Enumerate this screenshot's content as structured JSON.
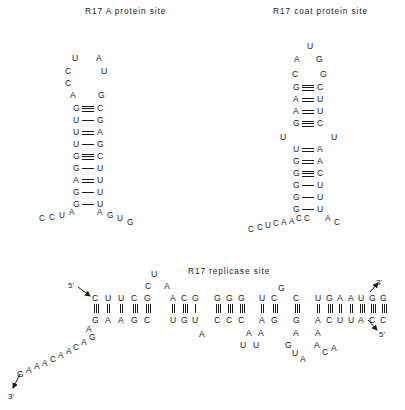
{
  "figure": {
    "background": "#ffffff",
    "ink": "#1a1a1a"
  },
  "panels": {
    "a_protein": {
      "title": "R17 A protein site",
      "loop_left": [
        "U",
        "C",
        "C",
        "A"
      ],
      "loop_right": [
        "A",
        "U",
        "G"
      ],
      "stem": [
        {
          "left": "G",
          "bond": "triple",
          "right": "C"
        },
        {
          "left": "U",
          "bond": "single",
          "right": "G"
        },
        {
          "left": "U",
          "bond": "double",
          "right": "A"
        },
        {
          "left": "U",
          "bond": "single",
          "right": "G"
        },
        {
          "left": "G",
          "bond": "triple",
          "right": "C"
        },
        {
          "left": "G",
          "bond": "single",
          "right": "U"
        },
        {
          "left": "A",
          "bond": "double",
          "right": "U"
        },
        {
          "left": "G",
          "bond": "single",
          "right": "U"
        },
        {
          "left": "G",
          "bond": "single",
          "right": "U"
        }
      ],
      "tail_left": [
        "C",
        "C",
        "U",
        "A"
      ],
      "tail_right": [
        "A",
        "G",
        "U",
        "G"
      ]
    },
    "coat_protein": {
      "title": "R17 coat protein site",
      "loop_top": "U",
      "loop_left": [
        "A",
        "C"
      ],
      "loop_right": [
        "G",
        "G"
      ],
      "stem_upper": [
        {
          "left": "G",
          "bond": "triple",
          "right": "C"
        },
        {
          "left": "A",
          "bond": "double",
          "right": "U"
        },
        {
          "left": "A",
          "bond": "double",
          "right": "U"
        },
        {
          "left": "G",
          "bond": "triple",
          "right": "C"
        }
      ],
      "bulge_left": "U",
      "bulge_right": "U",
      "stem_lower": [
        {
          "left": "U",
          "bond": "double",
          "right": "A"
        },
        {
          "left": "G",
          "bond": "double",
          "right": "A"
        },
        {
          "left": "G",
          "bond": "triple",
          "right": "C"
        },
        {
          "left": "G",
          "bond": "single",
          "right": "U"
        },
        {
          "left": "G",
          "bond": "single",
          "right": "U"
        },
        {
          "left": "G",
          "bond": "single",
          "right": "U"
        }
      ],
      "tail_left": [
        "C",
        "C",
        "U",
        "C",
        "A",
        "A",
        "C",
        "C"
      ],
      "tail_right": [
        "A",
        "C"
      ]
    },
    "replicase": {
      "title": "R17 replicase site",
      "label_5prime_left": "5'",
      "label_3prime_right": "3'",
      "label_5prime_right": "5'",
      "label_3prime_left": "3'",
      "top_strand": [
        "C",
        "U",
        "U",
        "C",
        "G",
        "A",
        "C",
        "G",
        "G",
        "G",
        "G",
        "U",
        "C",
        "C",
        "U",
        "G",
        "A",
        "A",
        "U",
        "G",
        "G"
      ],
      "bottom_strand": [
        "G",
        "A",
        "A",
        "G",
        "C",
        "U",
        "G",
        "U",
        "C",
        "C",
        "C",
        "A",
        "G",
        "G",
        "A",
        "C",
        "U",
        "U",
        "A",
        "C",
        "C"
      ],
      "top_loop_1": [
        "C",
        "U",
        "A"
      ],
      "top_loop_2": "G",
      "bottom_loop_1": [
        "A"
      ],
      "bottom_loop_2": [
        "A",
        "U"
      ],
      "bottom_loop_3": [
        "A",
        "U"
      ],
      "bottom_loop_4": [
        "A",
        "G",
        "U",
        "A"
      ],
      "bottom_loop_5": [
        "A",
        "A",
        "C",
        "A"
      ],
      "tail_left_lower": [
        "G",
        "A",
        "A",
        "A",
        "C",
        "A",
        "A",
        "C",
        "A",
        "G",
        "A"
      ]
    }
  }
}
